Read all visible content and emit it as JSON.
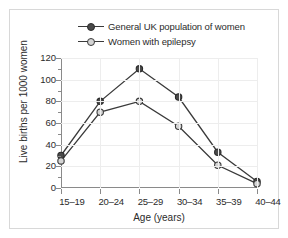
{
  "chart_data": {
    "type": "line",
    "title": "",
    "xlabel": "Age (years)",
    "ylabel": "Live births per 1000 women",
    "categories": [
      "15–19",
      "20–24",
      "25–29",
      "30–34",
      "35–39",
      "40–44"
    ],
    "ylim": [
      0,
      120
    ],
    "yticks": [
      0,
      20,
      40,
      60,
      80,
      100,
      120
    ],
    "yticks_minor": [
      10,
      30,
      50,
      70,
      90,
      110
    ],
    "grid": true,
    "legend_position": "top-center",
    "series": [
      {
        "name": "General UK population of women",
        "marker": "filled-circle",
        "color": "#4a4a4a",
        "values": [
          30,
          80,
          110,
          84,
          33,
          6
        ]
      },
      {
        "name": "Women with epilepsy",
        "marker": "open-circle",
        "color": "#d4d4d4",
        "values": [
          25,
          70,
          80,
          57,
          21,
          4
        ]
      }
    ]
  },
  "legend": {
    "items": [
      {
        "label": "General UK population of women",
        "marker": "filled-circle"
      },
      {
        "label": "Women with epilepsy",
        "marker": "open-circle"
      }
    ]
  },
  "axes": {
    "x_title": "Age (years)",
    "y_title": "Live births per 1000 women",
    "y_tick_labels": [
      "0",
      "20",
      "40",
      "60",
      "80",
      "100",
      "120"
    ],
    "x_tick_labels": [
      "15–19",
      "20–24",
      "25–29",
      "30–34",
      "35–39",
      "40–44"
    ]
  },
  "colors": {
    "series_dark": "#4a4a4a",
    "series_light": "#d4d4d4",
    "line": "#3a3a3a",
    "axis": "#8a8a8a",
    "grid": "#ededed",
    "border": "#d8d8d8",
    "text": "#2b2b2b"
  }
}
